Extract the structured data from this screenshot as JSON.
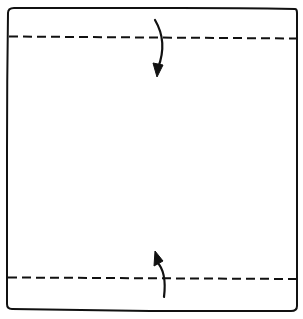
{
  "diagram": {
    "type": "origami-fold-step",
    "background": "#ffffff",
    "stroke": "#111111",
    "paper": {
      "shape": "square",
      "x": 6,
      "y": 8,
      "width": 291,
      "height": 302
    },
    "fold_lines": [
      {
        "id": "top-valley-fold",
        "style": "dashed",
        "y": 37,
        "x1": 8,
        "x2": 296
      },
      {
        "id": "bottom-valley-fold",
        "style": "dashed",
        "y": 278,
        "x1": 8,
        "x2": 296
      }
    ],
    "arrows": [
      {
        "id": "fold-top-edge-down",
        "direction": "down"
      },
      {
        "id": "fold-bottom-edge-up",
        "direction": "up"
      }
    ]
  }
}
